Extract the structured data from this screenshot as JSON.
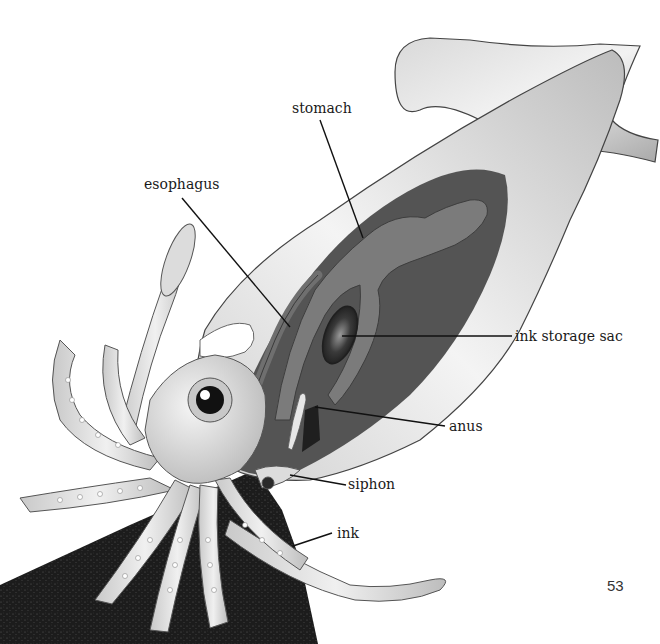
{
  "figure": {
    "colors": {
      "background": "#ffffff",
      "body_light": "#e6e6e6",
      "body_mid": "#bdbdbd",
      "outline": "#4a4a4a",
      "cavity": "#565656",
      "organ": "#7a7a7a",
      "ink_cloud": "#1e1e1e",
      "leader": "#111111"
    }
  },
  "labels": [
    {
      "id": "stomach",
      "text": "stomach"
    },
    {
      "id": "esophagus",
      "text": "esophagus"
    },
    {
      "id": "ink_storage_sac",
      "text": "ink storage sac"
    },
    {
      "id": "anus",
      "text": "anus"
    },
    {
      "id": "siphon",
      "text": "siphon"
    },
    {
      "id": "ink",
      "text": "ink"
    }
  ],
  "page_number": "53"
}
